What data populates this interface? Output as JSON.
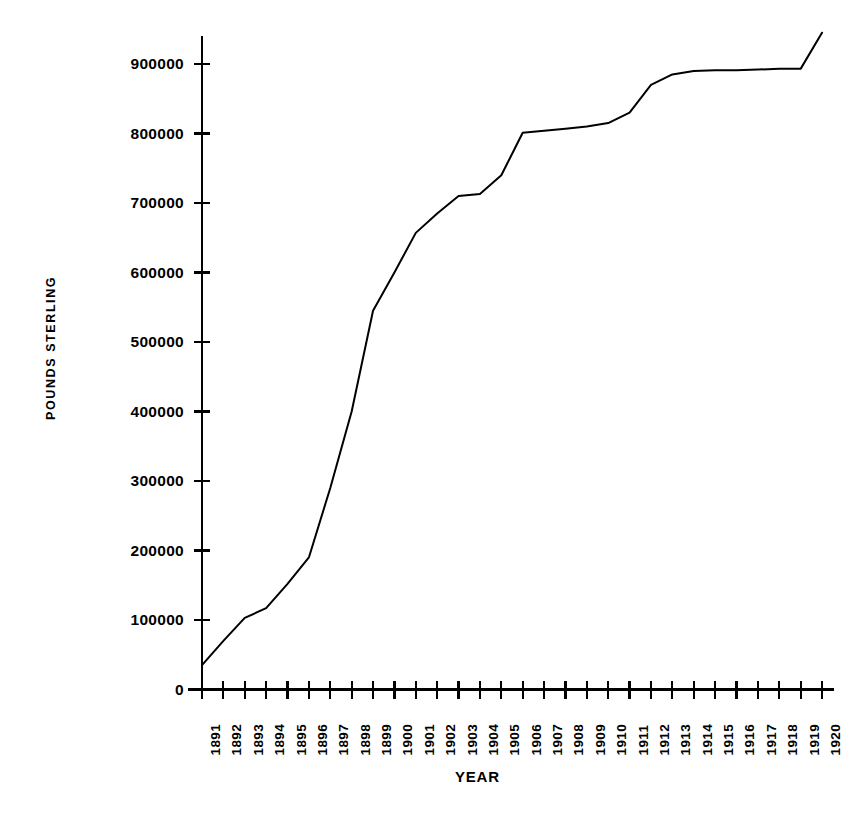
{
  "chart_data": {
    "type": "line",
    "title": "",
    "subtitle": "",
    "xlabel": "YEAR",
    "ylabel": "POUNDS STERLING",
    "grid": false,
    "legend": null,
    "legend_position": "none",
    "xlim": [
      1891,
      1920
    ],
    "ylim": [
      0,
      960000
    ],
    "y_ticks": [
      0,
      100000,
      200000,
      300000,
      400000,
      500000,
      600000,
      700000,
      800000,
      900000
    ],
    "y_tick_labels": [
      "0",
      "100000",
      "200000",
      "300000",
      "400000",
      "500000",
      "600000",
      "700000",
      "800000",
      "900000"
    ],
    "x_ticks": [
      1891,
      1892,
      1893,
      1894,
      1895,
      1896,
      1897,
      1898,
      1899,
      1900,
      1901,
      1902,
      1903,
      1904,
      1905,
      1906,
      1907,
      1908,
      1909,
      1910,
      1911,
      1912,
      1913,
      1914,
      1915,
      1916,
      1917,
      1918,
      1919,
      1920
    ],
    "x_tick_labels": [
      "1891",
      "1892",
      "1893",
      "1894",
      "1895",
      "1896",
      "1897",
      "1898",
      "1899",
      "1900",
      "1901",
      "1902",
      "1903",
      "1904",
      "1905",
      "1906",
      "1907",
      "1908",
      "1909",
      "1910",
      "1911",
      "1912",
      "1913",
      "1914",
      "1915",
      "1916",
      "1917",
      "1918",
      "1919",
      "1920"
    ],
    "x": [
      1891,
      1892,
      1893,
      1894,
      1895,
      1896,
      1897,
      1898,
      1899,
      1900,
      1901,
      1902,
      1903,
      1904,
      1905,
      1906,
      1907,
      1908,
      1909,
      1910,
      1911,
      1912,
      1913,
      1914,
      1915,
      1916,
      1917,
      1918,
      1919,
      1920
    ],
    "values": [
      35000,
      70000,
      103000,
      117000,
      152000,
      190000,
      290000,
      400000,
      545000,
      600000,
      657000,
      685000,
      710000,
      713000,
      740000,
      801000,
      804000,
      807000,
      810000,
      815000,
      830000,
      870000,
      885000,
      890000,
      891000,
      891000,
      892000,
      893000,
      893000,
      945000
    ],
    "series": [
      {
        "name": "Pounds Sterling",
        "color": "#000000",
        "values": [
          35000,
          70000,
          103000,
          117000,
          152000,
          190000,
          290000,
          400000,
          545000,
          600000,
          657000,
          685000,
          710000,
          713000,
          740000,
          801000,
          804000,
          807000,
          810000,
          815000,
          830000,
          870000,
          885000,
          890000,
          891000,
          891000,
          892000,
          893000,
          893000,
          945000
        ]
      }
    ]
  },
  "colors": {
    "background": "#ffffff",
    "axis": "#000000",
    "line": "#000000",
    "text": "#000000"
  }
}
